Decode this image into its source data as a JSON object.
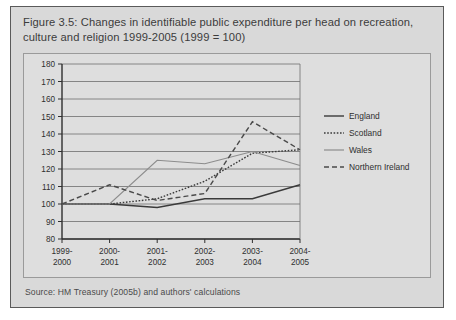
{
  "figure": {
    "title": "Figure 3.5: Changes in identifiable public expenditure per head on recreation, culture and religion 1999-2005 (1999 = 100)",
    "source": "Source: HM Treasury (2005b) and authors' calculations"
  },
  "colors": {
    "panel_background": "#d9d9d9",
    "plot_background": "#dedede",
    "panel_border": "#5a5a5a",
    "plot_border": "#9a9a9a",
    "gridline": "#6f6f6f",
    "england": "#3a3a3a",
    "scotland": "#3a3a3a",
    "wales": "#8c8c8c",
    "northern_ireland": "#4a4a4a",
    "text": "#3c3c3c"
  },
  "chart_data": {
    "type": "line",
    "title": "Changes in identifiable public expenditure per head on recreation, culture and religion 1999-2005 (1999 = 100)",
    "xlabel": "",
    "ylabel": "",
    "categories": [
      "1999-\n2000",
      "2000-\n2001",
      "2001-\n2002",
      "2002-\n2003",
      "2003-\n2004",
      "2004-\n2005"
    ],
    "category_lines": [
      [
        "1999-",
        "2000"
      ],
      [
        "2000-",
        "2001"
      ],
      [
        "2001-",
        "2002"
      ],
      [
        "2002-",
        "2003"
      ],
      [
        "2003-",
        "2004"
      ],
      [
        "2004-",
        "2005"
      ]
    ],
    "ylim": [
      80,
      180
    ],
    "yticks": [
      80,
      90,
      100,
      110,
      120,
      130,
      140,
      150,
      160,
      170,
      180
    ],
    "ytick_labels": [
      "80",
      "90",
      "100",
      "110",
      "120",
      "130",
      "140",
      "150",
      "160",
      "170",
      "180"
    ],
    "grid": true,
    "grid_axis": "y",
    "legend_position": "right",
    "series": [
      {
        "name": "England",
        "style": "solid",
        "color": "#3a3a3a",
        "width": 1.4,
        "values": [
          100,
          100,
          98,
          103,
          103,
          111
        ]
      },
      {
        "name": "Scotland",
        "style": "dotted",
        "color": "#3a3a3a",
        "width": 1.4,
        "values": [
          100,
          100,
          103,
          113,
          129,
          131
        ]
      },
      {
        "name": "Wales",
        "style": "solid",
        "color": "#8c8c8c",
        "width": 1.2,
        "values": [
          100,
          100,
          125,
          123,
          130,
          122
        ]
      },
      {
        "name": "Northern Ireland",
        "style": "dashed",
        "color": "#4a4a4a",
        "width": 1.4,
        "values": [
          100,
          111,
          102,
          106,
          147,
          131
        ]
      }
    ]
  },
  "legend": {
    "items": [
      {
        "label": "England"
      },
      {
        "label": "Scotland"
      },
      {
        "label": "Wales"
      },
      {
        "label": "Northern Ireland"
      }
    ]
  }
}
